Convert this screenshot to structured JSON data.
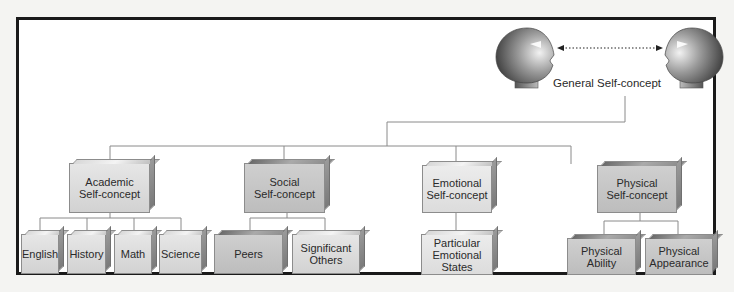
{
  "diagram": {
    "root": {
      "label": "General Self-concept"
    },
    "categories": [
      {
        "label_line1": "Academic",
        "label_line2": "Self-concept",
        "children": [
          {
            "label": "English"
          },
          {
            "label": "History"
          },
          {
            "label": "Math"
          },
          {
            "label": "Science"
          }
        ]
      },
      {
        "label_line1": "Social",
        "label_line2": "Self-concept",
        "children": [
          {
            "label": "Peers"
          },
          {
            "label_line1": "Significant",
            "label_line2": "Others"
          }
        ]
      },
      {
        "label_line1": "Emotional",
        "label_line2": "Self-concept",
        "children": [
          {
            "label_line1": "Particular",
            "label_line2": "Emotional",
            "label_line3": "States"
          }
        ]
      },
      {
        "label_line1": "Physical",
        "label_line2": "Self-concept",
        "children": [
          {
            "label_line1": "Physical",
            "label_line2": "Ability"
          },
          {
            "label_line1": "Physical",
            "label_line2": "Appearance"
          }
        ]
      }
    ],
    "icons": {
      "left_head": "head-profile-facing-right",
      "right_head": "head-profile-facing-left",
      "arrow": "dotted-double-arrow"
    },
    "colors": {
      "frame": "#1a1a1a",
      "connector": "#8a8a8a",
      "box_fill": "#dcdcdc",
      "box_edge": "#8c8c8c"
    }
  }
}
